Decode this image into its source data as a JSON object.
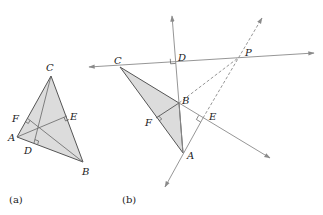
{
  "figure_a": {
    "caption": "(a)",
    "vertices": {
      "A": "A",
      "B": "B",
      "C": "C"
    },
    "feet": {
      "D": "D",
      "E": "E",
      "F": "F"
    }
  },
  "figure_b": {
    "caption": "(b)",
    "vertices": {
      "A": "A",
      "B": "B",
      "C": "C"
    },
    "feet": {
      "D": "D",
      "E": "E",
      "F": "F"
    },
    "intersection": "P"
  },
  "colors": {
    "fill": "#dcdcdc",
    "stroke": "#555555",
    "line": "#888888"
  }
}
